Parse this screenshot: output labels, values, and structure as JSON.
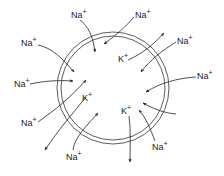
{
  "diagram": {
    "title": "",
    "cell": {
      "cx": 113,
      "cy": 88,
      "r_outer": 56,
      "r_inner": 52,
      "stroke": "#333333"
    },
    "ions": {
      "sodium": {
        "symbol": "Na",
        "charge": "+"
      },
      "potassium": {
        "symbol": "K",
        "charge": "+"
      }
    },
    "labels": [
      {
        "id": "na-top",
        "ion": "Na",
        "charge": "+",
        "x": 71,
        "y": 18
      },
      {
        "id": "na-top-right",
        "ion": "Na",
        "charge": "+",
        "x": 135,
        "y": 18
      },
      {
        "id": "na-upper-right",
        "ion": "Na",
        "charge": "+",
        "x": 177,
        "y": 44
      },
      {
        "id": "na-right",
        "ion": "Na",
        "charge": "+",
        "x": 197,
        "y": 79
      },
      {
        "id": "na-left-upper",
        "ion": "Na",
        "charge": "+",
        "x": 21,
        "y": 46
      },
      {
        "id": "na-left",
        "ion": "Na",
        "charge": "+",
        "x": 14,
        "y": 87
      },
      {
        "id": "na-lower-left",
        "ion": "Na",
        "charge": "+",
        "x": 21,
        "y": 126
      },
      {
        "id": "na-bottom-left",
        "ion": "Na",
        "charge": "+",
        "x": 66,
        "y": 160
      },
      {
        "id": "na-bottom-right",
        "ion": "Na",
        "charge": "+",
        "x": 152,
        "y": 150
      },
      {
        "id": "k-upper",
        "ion": "K",
        "charge": "+",
        "x": 118,
        "y": 62
      },
      {
        "id": "k-left",
        "ion": "K",
        "charge": "+",
        "x": 82,
        "y": 101
      },
      {
        "id": "k-right",
        "ion": "K",
        "charge": "+",
        "x": 121,
        "y": 114
      }
    ],
    "flows": [
      {
        "id": "na-top-in",
        "direction": "inward"
      },
      {
        "id": "na-top-right-in",
        "direction": "inward"
      },
      {
        "id": "na-upper-right-in",
        "direction": "inward"
      },
      {
        "id": "na-right-in",
        "direction": "inward"
      },
      {
        "id": "na-left-upper-in",
        "direction": "inward"
      },
      {
        "id": "na-left-in",
        "direction": "inward"
      },
      {
        "id": "na-lower-left-out",
        "direction": "outward"
      },
      {
        "id": "na-bottom-left-in",
        "direction": "inward"
      },
      {
        "id": "na-bottom-right-in",
        "direction": "inward"
      },
      {
        "id": "k-upper-out",
        "direction": "outward"
      },
      {
        "id": "k-left-out",
        "direction": "outward"
      },
      {
        "id": "k-right-out",
        "direction": "outward"
      }
    ]
  }
}
